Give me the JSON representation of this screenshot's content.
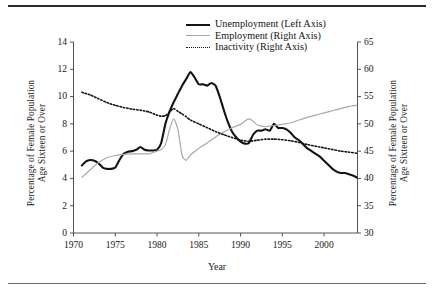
{
  "figure": {
    "top_rule": "horizontal-rule",
    "bottom_rule": "horizontal-rule"
  },
  "chart_data": {
    "type": "line",
    "title": "",
    "xlabel": "Year",
    "ylabel": "Percentage of Female Population Age Sixteen or Over",
    "ylabel_line1": "Percentage of Female Population",
    "ylabel_line2": "Age Sixteen or Over",
    "ylabel_right_line1": "Percentage of Female Population",
    "ylabel_right_line2": "Age Sixteen or Over",
    "xlim": [
      1970,
      2004
    ],
    "ylim_left": [
      0,
      14
    ],
    "ylim_right": [
      30,
      65
    ],
    "grid": false,
    "legend_position": "top-center",
    "x_ticks": [
      "1970",
      "1975",
      "1980",
      "1985",
      "1990",
      "1995",
      "2000"
    ],
    "x_tick_values": [
      1970,
      1975,
      1980,
      1985,
      1990,
      1995,
      2000
    ],
    "y_ticks_left": [
      "0",
      "2",
      "4",
      "6",
      "8",
      "10",
      "12",
      "14"
    ],
    "y_tick_values_left": [
      0,
      2,
      4,
      6,
      8,
      10,
      12,
      14
    ],
    "y_ticks_right": [
      "30",
      "35",
      "40",
      "45",
      "50",
      "55",
      "60",
      "65"
    ],
    "y_tick_values_right": [
      30,
      35,
      40,
      45,
      50,
      55,
      60,
      65
    ],
    "series": [
      {
        "name": "Unemployment (Left Axis)",
        "axis": "left",
        "color": "#141414",
        "style": "solid",
        "width": 2.1,
        "x": [
          1971.0,
          1971.5,
          1972.0,
          1972.5,
          1973.0,
          1973.5,
          1974.0,
          1974.5,
          1975.0,
          1975.5,
          1976.0,
          1976.5,
          1977.0,
          1977.5,
          1978.0,
          1978.5,
          1979.0,
          1979.5,
          1980.0,
          1980.5,
          1981.0,
          1981.5,
          1982.0,
          1982.5,
          1983.0,
          1983.5,
          1984.0,
          1984.5,
          1985.0,
          1985.5,
          1986.0,
          1986.5,
          1987.0,
          1987.5,
          1988.0,
          1988.5,
          1989.0,
          1989.5,
          1990.0,
          1990.5,
          1991.0,
          1991.5,
          1992.0,
          1992.5,
          1993.0,
          1993.5,
          1994.0,
          1994.5,
          1995.0,
          1995.5,
          1996.0,
          1996.5,
          1997.0,
          1997.5,
          1998.0,
          1998.5,
          1999.0,
          1999.5,
          2000.0,
          2000.5,
          2001.0,
          2001.5,
          2002.0,
          2002.5,
          2003.0,
          2003.5,
          2004.0
        ],
        "y": [
          4.95,
          5.25,
          5.35,
          5.3,
          5.1,
          4.8,
          4.7,
          4.7,
          4.8,
          5.35,
          5.8,
          5.95,
          6.0,
          6.1,
          6.3,
          6.1,
          6.05,
          6.05,
          6.1,
          6.6,
          8.0,
          8.9,
          9.6,
          10.2,
          10.8,
          11.3,
          11.8,
          11.4,
          10.9,
          10.9,
          10.8,
          11.0,
          10.8,
          10.0,
          9.0,
          8.1,
          7.4,
          7.0,
          6.7,
          6.55,
          6.6,
          7.2,
          7.5,
          7.5,
          7.6,
          7.5,
          8.0,
          7.7,
          7.7,
          7.6,
          7.35,
          7.0,
          6.8,
          6.5,
          6.2,
          6.0,
          5.8,
          5.6,
          5.3,
          5.0,
          4.7,
          4.5,
          4.4,
          4.4,
          4.3,
          4.2,
          4.05
        ]
      },
      {
        "name": "Employment (Right Axis)",
        "axis": "right",
        "color": "#a8a8a8",
        "style": "solid",
        "width": 1.2,
        "x": [
          1971.0,
          1972.0,
          1973.0,
          1974.0,
          1975.0,
          1976.0,
          1977.0,
          1978.0,
          1979.0,
          1980.0,
          1980.5,
          1981.0,
          1981.5,
          1982.0,
          1982.5,
          1983.0,
          1983.5,
          1984.0,
          1985.0,
          1986.0,
          1987.0,
          1988.0,
          1989.0,
          1990.0,
          1990.5,
          1991.0,
          1991.5,
          1992.0,
          1993.0,
          1994.0,
          1995.0,
          1996.0,
          1997.0,
          1998.0,
          1999.0,
          2000.0,
          2001.0,
          2002.0,
          2003.0,
          2004.0
        ],
        "y": [
          40.2,
          41.6,
          42.9,
          43.8,
          44.2,
          44.4,
          44.5,
          44.5,
          44.5,
          45.0,
          45.3,
          46.1,
          49.0,
          50.9,
          49.0,
          44.2,
          43.3,
          44.3,
          45.5,
          46.5,
          47.6,
          48.5,
          49.3,
          49.9,
          50.5,
          50.9,
          50.5,
          49.8,
          49.5,
          49.7,
          49.9,
          50.2,
          50.7,
          51.2,
          51.6,
          52.0,
          52.4,
          52.8,
          53.2,
          53.4
        ]
      },
      {
        "name": "Inactivity (Right Axis)",
        "axis": "right",
        "color": "#141414",
        "style": "dotted",
        "width": 1.6,
        "x": [
          1971.0,
          1972.0,
          1973.0,
          1974.0,
          1975.0,
          1976.0,
          1977.0,
          1978.0,
          1979.0,
          1980.0,
          1980.5,
          1981.0,
          1981.5,
          1982.0,
          1982.5,
          1983.0,
          1983.5,
          1984.0,
          1985.0,
          1986.0,
          1987.0,
          1988.0,
          1989.0,
          1990.0,
          1991.0,
          1992.0,
          1993.0,
          1994.0,
          1995.0,
          1996.0,
          1997.0,
          1998.0,
          1999.0,
          2000.0,
          2001.0,
          2002.0,
          2003.0,
          2004.0
        ],
        "y": [
          55.8,
          55.3,
          54.6,
          53.9,
          53.4,
          53.0,
          52.7,
          52.5,
          52.2,
          51.6,
          51.4,
          51.5,
          52.2,
          52.8,
          52.3,
          51.8,
          51.3,
          50.7,
          50.0,
          49.3,
          48.6,
          48.0,
          47.5,
          47.0,
          46.8,
          47.0,
          47.2,
          47.2,
          47.1,
          46.9,
          46.6,
          46.2,
          45.9,
          45.6,
          45.3,
          45.0,
          44.8,
          44.6
        ]
      }
    ],
    "legend": [
      {
        "label": "Unemployment (Left Axis)",
        "swatch": "thick-solid-black"
      },
      {
        "label": "Employment (Right Axis)",
        "swatch": "thin-solid-gray"
      },
      {
        "label": "Inactivity (Right Axis)",
        "swatch": "dotted-black"
      }
    ]
  }
}
